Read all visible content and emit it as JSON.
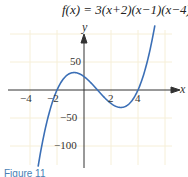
{
  "chart_data": {
    "type": "line",
    "title": "f(x) = 3(x+2)(x−1)(x−4)",
    "function": "3(x+2)(x-1)(x-4)",
    "xlabel": "x",
    "ylabel": "y",
    "xlim": [
      -4.5,
      5.8
    ],
    "ylim": [
      -130,
      115
    ],
    "x_ticks": [
      -4,
      -2,
      2,
      4
    ],
    "x_tick_labels": [
      "−4",
      "−2",
      "2",
      "4"
    ],
    "y_ticks": [
      50,
      -50,
      -100
    ],
    "y_tick_labels": [
      "50",
      "−50",
      "−100"
    ],
    "grid": true,
    "series": [
      {
        "name": "f(x)",
        "color": "#3b6fb6",
        "x": [
          -3.6,
          -3,
          -2,
          -1,
          -0.73,
          0,
          1,
          2,
          2.73,
          3,
          4,
          5,
          5.7
        ],
        "y": [
          -127.7,
          -84,
          0,
          30,
          31.2,
          24,
          0,
          -24,
          -31.2,
          -30,
          0,
          84,
          170.9
        ]
      }
    ],
    "roots": [
      -2,
      1,
      4
    ],
    "y_intercept": 24
  },
  "caption": "Figure 11"
}
